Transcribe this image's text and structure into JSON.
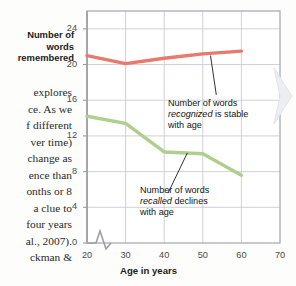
{
  "page": {
    "clipped_top_line": "",
    "body_text_lines": [
      "explores",
      "ce. As we",
      "f different",
      "ver time)",
      "change as",
      "ence than",
      "onths or 8",
      "a clue to",
      "four years",
      "al., 2007).",
      "ckman &"
    ]
  },
  "chart_data": {
    "type": "line",
    "title": "",
    "xlabel": "Age in years",
    "ylabel": "Number of words remembered",
    "x": [
      20,
      30,
      40,
      50,
      60
    ],
    "xlim": [
      20,
      70
    ],
    "ylim": [
      0,
      26
    ],
    "xticks": [
      20,
      30,
      40,
      50,
      60,
      70
    ],
    "yticks": [
      0,
      4,
      8,
      12,
      16,
      20,
      24
    ],
    "grid": true,
    "axis_break": true,
    "legend_position": "none",
    "series": [
      {
        "name": "recognized",
        "color": "#e8796b",
        "values": [
          21.0,
          20.1,
          20.7,
          21.2,
          21.5
        ]
      },
      {
        "name": "recalled",
        "color": "#aed08c",
        "values": [
          14.2,
          13.4,
          10.2,
          10.0,
          7.6
        ]
      }
    ],
    "annotations": [
      {
        "id": "recognized",
        "line1": "Number of words",
        "emphasis": "recognized",
        "line2_tail": " is stable",
        "line3": "with age"
      },
      {
        "id": "recalled",
        "line1": "Number of words",
        "emphasis": "recalled",
        "line2_tail": " declines",
        "line3": "with age"
      }
    ]
  }
}
